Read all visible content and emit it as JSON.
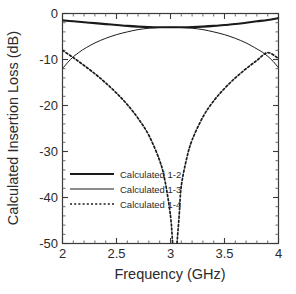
{
  "chart_data": {
    "type": "line",
    "title": "",
    "xlabel": "Frequency (GHz)",
    "ylabel": "Calculated Insertion Loss (dB)",
    "xlim": [
      2,
      4
    ],
    "ylim": [
      -50,
      0
    ],
    "xticks": [
      "2",
      "2.5",
      "3",
      "3.5",
      "4"
    ],
    "xtick_values": [
      2,
      2.5,
      3,
      3.5,
      4
    ],
    "yticks": [
      "0",
      "-10",
      "-20",
      "-30",
      "-40",
      "-50"
    ],
    "ytick_values": [
      0,
      -10,
      -20,
      -30,
      -40,
      -50
    ],
    "grid": false,
    "legend_position": "center-left",
    "minor_ticks_per_interval": 5,
    "series": [
      {
        "name": "Calculated 1-2",
        "style": "solid-thick",
        "color": "#1a1a1a",
        "x": [
          2.0,
          2.1,
          2.2,
          2.3,
          2.4,
          2.5,
          2.6,
          2.7,
          2.8,
          2.9,
          3.0,
          3.1,
          3.2,
          3.3,
          3.4,
          3.5,
          3.6,
          3.7,
          3.8,
          3.9,
          4.0
        ],
        "values": [
          -1.5,
          -1.7,
          -1.9,
          -2.1,
          -2.3,
          -2.5,
          -2.7,
          -2.85,
          -2.95,
          -3.0,
          -3.0,
          -3.0,
          -2.95,
          -2.85,
          -2.7,
          -2.5,
          -2.3,
          -2.0,
          -1.7,
          -1.4,
          -1.0
        ]
      },
      {
        "name": "Calculated 1-3",
        "style": "solid-thin",
        "color": "#1a1a1a",
        "x": [
          2.0,
          2.05,
          2.1,
          2.15,
          2.2,
          2.3,
          2.4,
          2.5,
          2.6,
          2.7,
          2.8,
          2.9,
          3.0,
          3.1,
          3.2,
          3.3,
          3.4,
          3.5,
          3.6,
          3.7,
          3.8,
          3.85,
          3.9,
          3.95,
          4.0
        ],
        "values": [
          -12.0,
          -10.6,
          -9.4,
          -8.5,
          -7.7,
          -6.4,
          -5.4,
          -4.6,
          -4.0,
          -3.5,
          -3.2,
          -3.05,
          -3.0,
          -3.05,
          -3.2,
          -3.5,
          -4.0,
          -4.6,
          -5.4,
          -6.4,
          -7.7,
          -8.4,
          -9.3,
          -10.4,
          -11.8
        ]
      },
      {
        "name": "Calculated 1-4",
        "style": "dotted",
        "color": "#1a1a1a",
        "x": [
          2.0,
          2.1,
          2.2,
          2.3,
          2.4,
          2.5,
          2.6,
          2.7,
          2.8,
          2.9,
          2.95,
          3.0,
          3.02,
          3.04,
          3.06,
          3.08,
          3.1,
          3.15,
          3.2,
          3.3,
          3.4,
          3.5,
          3.6,
          3.7,
          3.8,
          3.9,
          4.0
        ],
        "values": [
          -8.0,
          -9.6,
          -11.3,
          -13.1,
          -15.1,
          -17.3,
          -19.8,
          -22.8,
          -26.5,
          -32.0,
          -36.5,
          -44.0,
          -50.0,
          -56.0,
          -50.0,
          -44.0,
          -37.5,
          -31.5,
          -27.5,
          -22.5,
          -19.0,
          -16.3,
          -14.0,
          -12.0,
          -10.2,
          -8.5,
          -9.8
        ]
      }
    ]
  },
  "legend": {
    "items": [
      {
        "label": "Calculated 1-2",
        "style": "solid-thick"
      },
      {
        "label": "Calculated 1-3",
        "style": "solid-thin"
      },
      {
        "label": "Calculated 1-4",
        "style": "dotted"
      }
    ]
  },
  "axes": {
    "x_title": "Frequency (GHz)",
    "y_title": "Calculated Insertion Loss (dB)"
  }
}
